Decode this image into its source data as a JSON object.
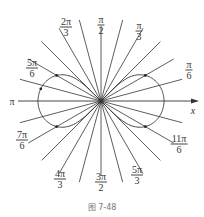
{
  "diagram": {
    "type": "polar-graph",
    "curve": "lemniscate-like two-loop curve",
    "axis_label_x": "x",
    "axis_label_pi": "π",
    "ray_step_degrees": 15,
    "angle_labels": [
      {
        "id": "pi-6",
        "num": "π",
        "den": "6"
      },
      {
        "id": "pi-3",
        "num": "π",
        "den": "3"
      },
      {
        "id": "pi-2",
        "num": "π",
        "den": "2"
      },
      {
        "id": "2pi-3",
        "num": "2π",
        "den": "3"
      },
      {
        "id": "5pi-6",
        "num": "5π",
        "den": "6"
      },
      {
        "id": "7pi-6",
        "num": "7π",
        "den": "6"
      },
      {
        "id": "4pi-3",
        "num": "4π",
        "den": "3"
      },
      {
        "id": "3pi-2",
        "num": "3π",
        "den": "2"
      },
      {
        "id": "5pi-3",
        "num": "5π",
        "den": "3"
      },
      {
        "id": "11pi-6",
        "num": "11π",
        "den": "6"
      }
    ],
    "caption": "图 7-48",
    "colors": {
      "line": "#333333",
      "caption": "#777777"
    }
  }
}
